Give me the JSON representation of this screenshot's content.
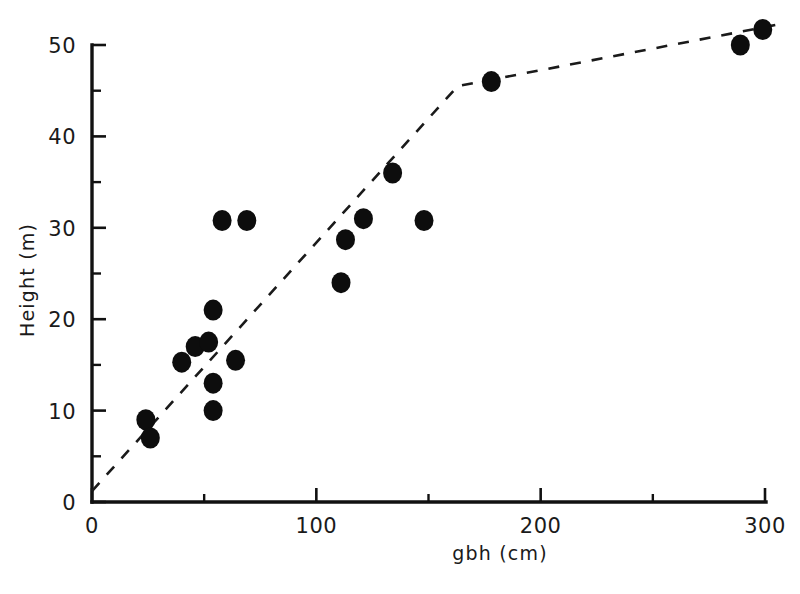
{
  "figure": {
    "background_color": "#ffffff",
    "marker_color": "#0d0d0d",
    "line_color": "#1a1a1a"
  },
  "axes": {
    "x_title": "gbh (cm)",
    "y_title": "Height (m)",
    "x_ticks": [
      "0",
      "100",
      "200",
      "300"
    ],
    "y_ticks": [
      "0",
      "10",
      "20",
      "30",
      "40",
      "50"
    ]
  },
  "chart_data": {
    "type": "scatter",
    "title": "",
    "xlabel": "gbh (cm)",
    "ylabel": "Height (m)",
    "xlim": [
      0,
      305
    ],
    "ylim": [
      0,
      53
    ],
    "xticks": [
      0,
      100,
      200,
      300
    ],
    "yticks": [
      0,
      10,
      20,
      30,
      40,
      50
    ],
    "xminor_ticks": [
      50,
      150,
      250
    ],
    "yminor_ticks": [
      5,
      15,
      25,
      35,
      45
    ],
    "grid": false,
    "legend": null,
    "marker": "filled-circle",
    "marker_size_px": 9,
    "points": [
      {
        "x": 24,
        "y": 9.0
      },
      {
        "x": 26,
        "y": 7.0
      },
      {
        "x": 40,
        "y": 15.3
      },
      {
        "x": 46,
        "y": 17.0
      },
      {
        "x": 52,
        "y": 17.5
      },
      {
        "x": 54,
        "y": 21.0
      },
      {
        "x": 54,
        "y": 13.0
      },
      {
        "x": 54,
        "y": 10.0
      },
      {
        "x": 58,
        "y": 30.8
      },
      {
        "x": 64,
        "y": 15.5
      },
      {
        "x": 69,
        "y": 30.8
      },
      {
        "x": 111,
        "y": 24.0
      },
      {
        "x": 113,
        "y": 28.7
      },
      {
        "x": 121,
        "y": 31.0
      },
      {
        "x": 134,
        "y": 36.0
      },
      {
        "x": 148,
        "y": 30.8
      },
      {
        "x": 178,
        "y": 46.0
      },
      {
        "x": 289,
        "y": 50.0
      },
      {
        "x": 299,
        "y": 51.7
      }
    ],
    "series": [
      {
        "name": "fitted-piecewise-line",
        "style": "dashed",
        "vertices": [
          {
            "x": 0,
            "y": 1.2
          },
          {
            "x": 163,
            "y": 45.5
          },
          {
            "x": 305,
            "y": 52.2
          }
        ]
      }
    ]
  }
}
